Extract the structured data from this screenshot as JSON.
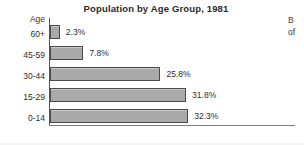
{
  "chart_data": {
    "type": "bar",
    "orientation": "horizontal",
    "title": "Population by Age Group, 1981",
    "xlabel": "",
    "ylabel": "Age",
    "axis_header": "Age",
    "categories": [
      "60+",
      "45-59",
      "30-44",
      "15-29",
      "0-14"
    ],
    "values": [
      2.3,
      7.8,
      25.8,
      31.8,
      32.3
    ],
    "value_labels": [
      "2.3%",
      "7.8%",
      "25.8%",
      "31.8%",
      "32.3%"
    ],
    "xlim": [
      0,
      35
    ],
    "grid": false,
    "legend": null,
    "bar_color": "#a9a9a9",
    "bar_border_color": "#4a4a4a",
    "text_color": "#2e2e2e",
    "background": "#ffffff"
  },
  "edge_note": {
    "line1": "B",
    "line2": "of"
  }
}
